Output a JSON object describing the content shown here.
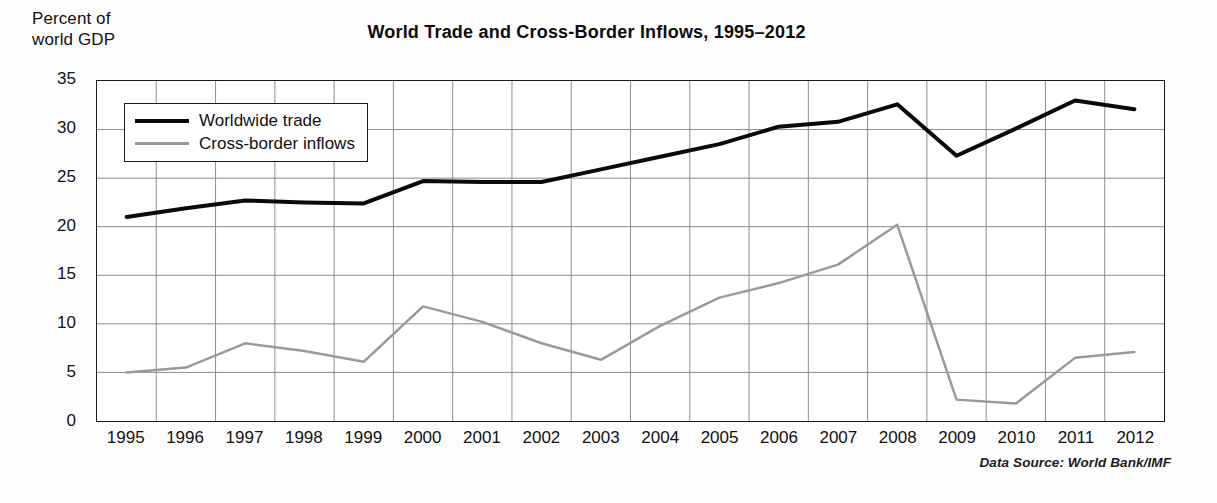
{
  "figure": {
    "title": "World Trade and Cross-Border Inflows, 1995–2012",
    "y_axis_caption": "Percent of\nworld GDP",
    "data_source": "Data Source: World Bank/IMF"
  },
  "legend": {
    "position": "top-left-inside",
    "entries": [
      {
        "label": "Worldwide trade",
        "color": "#0a0a0a",
        "style": "thick-solid"
      },
      {
        "label": "Cross-border inflows",
        "color": "#9a9a9a",
        "style": "thin-solid"
      }
    ]
  },
  "axes": {
    "y_ticks": [
      "0",
      "5",
      "10",
      "15",
      "20",
      "25",
      "30",
      "35"
    ],
    "x_ticks": [
      "1995",
      "1996",
      "1997",
      "1998",
      "1999",
      "2000",
      "2001",
      "2002",
      "2003",
      "2004",
      "2005",
      "2006",
      "2007",
      "2008",
      "2009",
      "2010",
      "2011",
      "2012"
    ]
  },
  "chart_data": {
    "type": "line",
    "title": "World Trade and Cross-Border Inflows, 1995–2012",
    "subtitle": "",
    "xlabel": "",
    "ylabel": "Percent of world GDP",
    "x": [
      1995,
      1996,
      1997,
      1998,
      1999,
      2000,
      2001,
      2002,
      2003,
      2004,
      2005,
      2006,
      2007,
      2008,
      2009,
      2010,
      2011,
      2012
    ],
    "categories": [
      "1995",
      "1996",
      "1997",
      "1998",
      "1999",
      "2000",
      "2001",
      "2002",
      "2003",
      "2004",
      "2005",
      "2006",
      "2007",
      "2008",
      "2009",
      "2010",
      "2011",
      "2012"
    ],
    "series": [
      {
        "name": "Worldwide trade",
        "color": "#0a0a0a",
        "linewidth": 4,
        "values": [
          21.0,
          21.9,
          22.7,
          22.5,
          22.4,
          24.7,
          24.6,
          24.6,
          25.9,
          27.2,
          28.5,
          30.3,
          30.8,
          32.6,
          27.3,
          30.1,
          33.0,
          32.1
        ]
      },
      {
        "name": "Cross-border inflows",
        "color": "#9a9a9a",
        "linewidth": 2.5,
        "values": [
          5.0,
          5.5,
          8.0,
          7.2,
          6.1,
          11.8,
          10.2,
          8.0,
          6.3,
          9.8,
          12.7,
          14.2,
          16.1,
          20.2,
          2.2,
          1.8,
          6.5,
          7.1
        ]
      }
    ],
    "series_note": "Cross-border inflows peaks at 20.2 in 2007 and collapses to 2.2 in 2008",
    "xlim": [
      1995,
      2012
    ],
    "ylim": [
      0,
      35
    ],
    "ytick_step": 5,
    "grid": true,
    "grid_color": "#8d8d8d",
    "legend_position": "upper left (inside axes)"
  }
}
